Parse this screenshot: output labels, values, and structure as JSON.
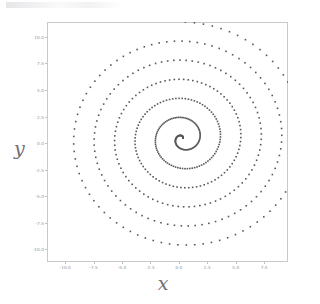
{
  "figure": {
    "background_color": "#ffffff",
    "frame_color": "#c9c9cd",
    "marker_color": "#58585c",
    "tick_label_color": "#8e8e93",
    "axis_title_color": "#6e6e73"
  },
  "axes": {
    "x_title": "x",
    "y_title": "y",
    "x_ticks": [
      "-10.0",
      "-7.5",
      "-5.0",
      "-2.5",
      "0.0",
      "2.5",
      "5.0",
      "7.5"
    ],
    "y_ticks": [
      "10.0",
      "7.5",
      "5.0",
      "2.5",
      "0.0",
      "-2.5",
      "-5.0",
      "-7.5",
      "-10.0"
    ]
  },
  "chart_data": {
    "type": "scatter",
    "title": "",
    "xlabel": "x",
    "ylabel": "y",
    "xlim": [
      -11.6,
      9.6
    ],
    "ylim": [
      -11.2,
      11.4
    ],
    "grid": false,
    "legend": null,
    "x_tick_values": [
      -10.0,
      -7.5,
      -5.0,
      -2.5,
      0.0,
      2.5,
      5.0,
      7.5
    ],
    "y_tick_values": [
      10.0,
      7.5,
      5.0,
      2.5,
      0.0,
      -2.5,
      -5.0,
      -7.5,
      -10.0
    ],
    "marker": "square",
    "marker_size_px": 1.6,
    "spiral": {
      "form": "r = a + b*theta",
      "a": 0.0,
      "b": 0.2865,
      "theta_start": 0.0,
      "theta_end": 38.2,
      "n_points": 520,
      "center_x": 0.35,
      "center_y": 0.45,
      "phase": 1.05
    },
    "series": [
      {
        "name": "spiral",
        "color": "#58585c",
        "n_points": 520
      }
    ]
  }
}
